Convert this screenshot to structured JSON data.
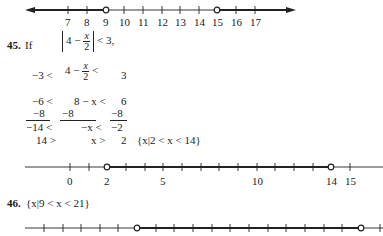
{
  "number_line_top": {
    "labels": [
      "7",
      "8",
      "9",
      "10",
      "11",
      "12",
      "13",
      "14",
      "15",
      "16",
      "17"
    ],
    "open_points": [
      "9",
      "15"
    ],
    "shaded": "x < 9 or x > 15"
  },
  "problem45": {
    "number": "45.",
    "intro": "If",
    "inequality": {
      "left": "4 −",
      "frac_num": "x",
      "frac_den": "2",
      "right": "< 3,"
    },
    "steps": [
      {
        "a": "−3 <",
        "b": "4 −",
        "frac_num": "x",
        "frac_den": "2",
        "c": "<",
        "d": "3"
      },
      {
        "a": "−6 <",
        "b": "8 − x <",
        "d": "6"
      },
      {
        "a": "−8",
        "b": "−8",
        "d": "−8"
      },
      {
        "a": "−14 <",
        "b": "−x <",
        "d": "−2"
      },
      {
        "a": "14 >",
        "b": "x >",
        "d": "2"
      }
    ],
    "solution": "{x|2 < x < 14}",
    "number_line": {
      "labels": [
        "0",
        "2",
        "5",
        "10",
        "14",
        "15"
      ],
      "open_points": [
        "2",
        "14"
      ]
    }
  },
  "problem46": {
    "number": "46.",
    "solution": "{x|9 < x < 21}",
    "number_line": {
      "open_points": [
        "9",
        "21"
      ]
    }
  }
}
